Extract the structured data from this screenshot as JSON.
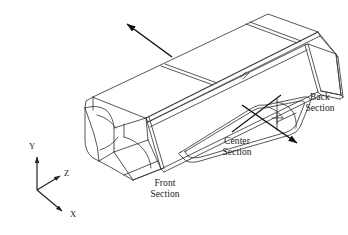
{
  "figure": {
    "type": "isometric-engineering-drawing",
    "background_color": "#ffffff",
    "line_color": "#3a3a3a",
    "arrow_color": "#111111",
    "text_color": "#1a1a1a"
  },
  "callouts": [
    {
      "id": "front-section",
      "line1": "Front",
      "line2": "Section",
      "x": 157,
      "y": 183,
      "has_leader": false
    },
    {
      "id": "center-section",
      "line1": "Center",
      "line2": "Section",
      "x": 236,
      "y": 140,
      "has_leader": true
    },
    {
      "id": "back-section",
      "line1": "Back",
      "line2": "Section",
      "x": 300,
      "y": 97,
      "has_leader": true
    }
  ],
  "axes": {
    "origin": {
      "x": 37,
      "y": 190
    },
    "items": [
      {
        "name": "Y",
        "label": "Y",
        "label_x": 29,
        "label_y": 145,
        "tip_x": 37,
        "tip_y": 155
      },
      {
        "name": "Z",
        "label": "Z",
        "label_x": 64,
        "label_y": 172,
        "tip_x": 58,
        "tip_y": 176
      },
      {
        "name": "X",
        "label": "X",
        "label_x": 70,
        "label_y": 213,
        "tip_x": 62,
        "tip_y": 212
      }
    ]
  },
  "direction_arrow": {
    "name": "flow-direction-arrow",
    "from_x": 172,
    "from_y": 57,
    "to_x": 125,
    "to_y": 22,
    "label": ""
  }
}
